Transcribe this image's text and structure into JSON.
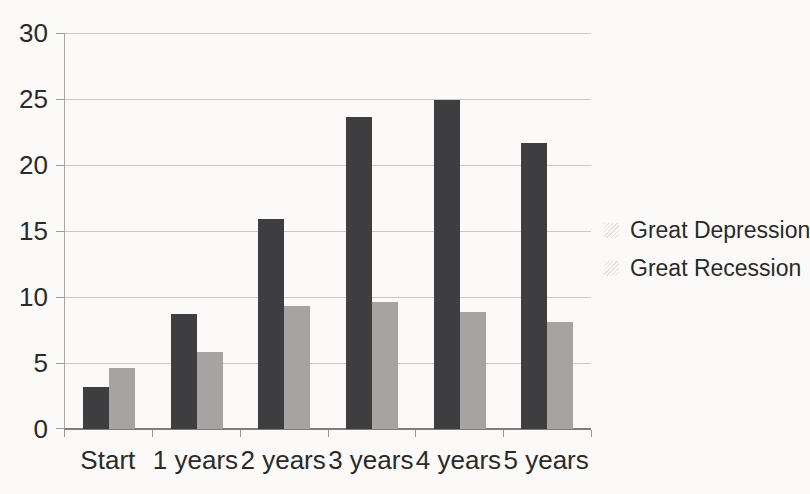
{
  "figure": {
    "background": "#fbfaf8",
    "text_color": "#2a2a2a",
    "gridline_color": "#c9c9c7",
    "axis_color": "#7d7d7b"
  },
  "chart_data": {
    "type": "bar",
    "categories": [
      "Start",
      "1 years",
      "2 years",
      "3 years",
      "4 years",
      "5 years"
    ],
    "series": [
      {
        "name": "Great Depression",
        "color": "#3e3e40",
        "values": [
          3.2,
          8.7,
          15.9,
          23.6,
          24.9,
          21.7
        ]
      },
      {
        "name": "Great Recession",
        "color": "#a5a4a2",
        "values": [
          4.6,
          5.8,
          9.3,
          9.6,
          8.9,
          8.1
        ]
      }
    ],
    "title": "",
    "xlabel": "",
    "ylabel": "",
    "ylim": [
      0,
      30
    ],
    "ytick_step": 5,
    "ytick_labels": [
      "0",
      "5",
      "10",
      "15",
      "20",
      "25",
      "30"
    ],
    "grid": true,
    "legend_position": "right"
  }
}
